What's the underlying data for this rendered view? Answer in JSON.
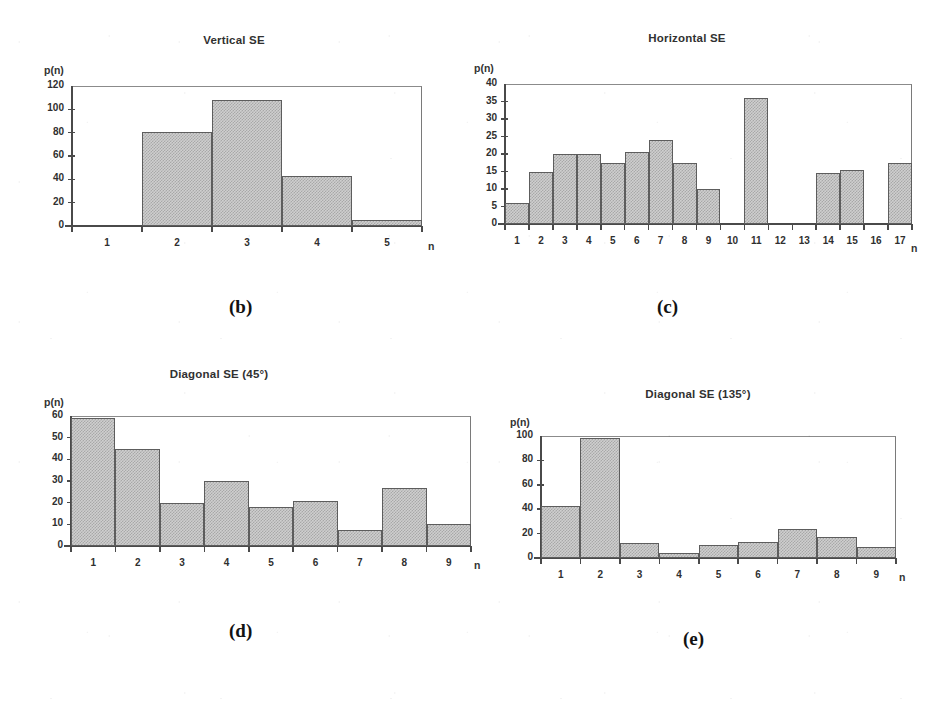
{
  "figure": {
    "background_color": "#ffffff",
    "bar_fill_color": "#cfcfcf",
    "bar_edge_color": "#5d5d5d",
    "axis_color": "#4a4a4a"
  },
  "panels": [
    {
      "key": "b",
      "subfig_label": "(b)",
      "chart_data": {
        "type": "bar",
        "title": "Vertical SE",
        "xlabel": "n",
        "ylabel": "p(n)",
        "categories": [
          "1",
          "2",
          "3",
          "4",
          "5"
        ],
        "values": [
          0,
          81,
          108,
          43,
          5
        ],
        "ylim": [
          0,
          120
        ],
        "yticks": [
          0,
          20,
          40,
          60,
          80,
          100,
          120
        ],
        "ytick_labels": [
          "0",
          "20",
          "40",
          "60",
          "80",
          "100",
          "120"
        ],
        "grid": false,
        "legend": "none"
      }
    },
    {
      "key": "c",
      "subfig_label": "(c)",
      "chart_data": {
        "type": "bar",
        "title": "Horizontal SE",
        "xlabel": "n",
        "ylabel": "p(n)",
        "categories": [
          "1",
          "2",
          "3",
          "4",
          "5",
          "6",
          "7",
          "8",
          "9",
          "10",
          "11",
          "12",
          "13",
          "14",
          "15",
          "16",
          "17"
        ],
        "values": [
          6,
          15,
          20,
          20,
          17.5,
          20.5,
          24,
          17.5,
          10,
          0,
          36,
          0,
          0,
          14.5,
          15.5,
          0,
          17.5
        ],
        "ylim": [
          0,
          40
        ],
        "yticks": [
          0,
          5,
          10,
          15,
          20,
          25,
          30,
          35,
          40
        ],
        "ytick_labels": [
          "0",
          "5",
          "10",
          "15",
          "20",
          "25",
          "30",
          "35",
          "40"
        ],
        "grid": false,
        "legend": "none"
      }
    },
    {
      "key": "d",
      "subfig_label": "(d)",
      "chart_data": {
        "type": "bar",
        "title": "Diagonal SE (45°)",
        "xlabel": "n",
        "ylabel": "p(n)",
        "categories": [
          "1",
          "2",
          "3",
          "4",
          "5",
          "6",
          "7",
          "8",
          "9"
        ],
        "values": [
          59,
          45,
          20,
          30,
          18,
          21,
          7.5,
          27,
          10
        ],
        "ylim": [
          0,
          60
        ],
        "yticks": [
          0,
          10,
          20,
          30,
          40,
          50,
          60
        ],
        "ytick_labels": [
          "0",
          "10",
          "20",
          "30",
          "40",
          "50",
          "60"
        ],
        "grid": false,
        "legend": "none"
      }
    },
    {
      "key": "e",
      "subfig_label": "(e)",
      "chart_data": {
        "type": "bar",
        "title": "Diagonal SE (135°)",
        "xlabel": "n",
        "ylabel": "p(n)",
        "categories": [
          "1",
          "2",
          "3",
          "4",
          "5",
          "6",
          "7",
          "8",
          "9"
        ],
        "values": [
          43,
          98,
          12,
          4,
          11,
          13,
          24,
          17,
          9
        ],
        "ylim": [
          0,
          100
        ],
        "yticks": [
          0,
          20,
          40,
          60,
          80,
          100
        ],
        "ytick_labels": [
          "0",
          "20",
          "40",
          "60",
          "80",
          "100"
        ],
        "grid": false,
        "legend": "none"
      }
    }
  ]
}
